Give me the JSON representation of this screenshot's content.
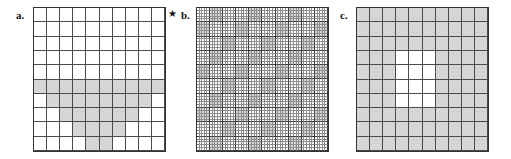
{
  "figure": {
    "width": 511,
    "height": 159,
    "background": "#ffffff",
    "shaded_color": "#d6d6d6",
    "empty_color": "#ffffff",
    "grid_line_color": "#4a4a4a",
    "fine_grid_line_color": "#8d8d8d",
    "fine_major_line_color": "#3a3a3a",
    "border_color": "#333333"
  },
  "marks": {
    "star": {
      "glyph": "★",
      "name": "star-mark",
      "x": 168,
      "y": 9
    }
  },
  "panels": [
    {
      "id": "a",
      "label": "a.",
      "label_x": 16,
      "label_y": 10,
      "grid_x": 33,
      "grid_y": 7,
      "grid_w": 133,
      "grid_h": 145,
      "cols": 10,
      "rows": 10,
      "style": "coarse",
      "description": "stepped pyramid of shaded cells rising from the bottom row",
      "shaded_cells": [
        [
          0,
          5
        ],
        [
          1,
          5
        ],
        [
          2,
          5
        ],
        [
          3,
          5
        ],
        [
          4,
          5
        ],
        [
          5,
          5
        ],
        [
          6,
          5
        ],
        [
          7,
          5
        ],
        [
          8,
          5
        ],
        [
          9,
          5
        ],
        [
          1,
          6
        ],
        [
          2,
          6
        ],
        [
          3,
          6
        ],
        [
          4,
          6
        ],
        [
          5,
          6
        ],
        [
          6,
          6
        ],
        [
          7,
          6
        ],
        [
          8,
          6
        ],
        [
          2,
          7
        ],
        [
          3,
          7
        ],
        [
          4,
          7
        ],
        [
          5,
          7
        ],
        [
          6,
          7
        ],
        [
          7,
          7
        ],
        [
          3,
          8
        ],
        [
          4,
          8
        ],
        [
          5,
          8
        ],
        [
          6,
          8
        ],
        [
          4,
          9
        ],
        [
          5,
          9
        ]
      ]
    },
    {
      "id": "b",
      "label": "b.",
      "label_x": 181,
      "label_y": 10,
      "grid_x": 196,
      "grid_y": 7,
      "grid_w": 133,
      "grid_h": 145,
      "cols": 50,
      "rows": 50,
      "major_every": 5,
      "style": "fine",
      "description": "fine 50x50 grid with diagonal bands of shaded 5x5 blocks",
      "block_size": 5,
      "block_cols": 10,
      "block_rows": 10,
      "shaded_blocks": [
        [
          1,
          0
        ],
        [
          4,
          0
        ],
        [
          7,
          0
        ],
        [
          0,
          1
        ],
        [
          3,
          1
        ],
        [
          6,
          1
        ],
        [
          9,
          1
        ],
        [
          2,
          2
        ],
        [
          5,
          2
        ],
        [
          8,
          2
        ],
        [
          1,
          3
        ],
        [
          4,
          3
        ],
        [
          7,
          3
        ],
        [
          0,
          4
        ],
        [
          3,
          4
        ],
        [
          6,
          4
        ],
        [
          9,
          4
        ],
        [
          2,
          5
        ],
        [
          5,
          5
        ],
        [
          8,
          5
        ],
        [
          1,
          6
        ],
        [
          4,
          6
        ],
        [
          7,
          6
        ],
        [
          0,
          7
        ],
        [
          3,
          7
        ],
        [
          6,
          7
        ],
        [
          9,
          7
        ],
        [
          2,
          8
        ],
        [
          5,
          8
        ],
        [
          8,
          8
        ],
        [
          1,
          9
        ],
        [
          4,
          9
        ],
        [
          7,
          9
        ]
      ]
    },
    {
      "id": "c",
      "label": "c.",
      "label_x": 340,
      "label_y": 10,
      "grid_x": 356,
      "grid_y": 7,
      "grid_w": 133,
      "grid_h": 145,
      "cols": 10,
      "rows": 10,
      "style": "coarse",
      "description": "all cells shaded except an interior white rectangle 3 wide by 4 tall",
      "inverted": true,
      "white_cells": [
        [
          3,
          3
        ],
        [
          4,
          3
        ],
        [
          5,
          3
        ],
        [
          3,
          4
        ],
        [
          4,
          4
        ],
        [
          5,
          4
        ],
        [
          3,
          5
        ],
        [
          4,
          5
        ],
        [
          5,
          5
        ],
        [
          3,
          6
        ],
        [
          4,
          6
        ],
        [
          5,
          6
        ]
      ]
    }
  ]
}
